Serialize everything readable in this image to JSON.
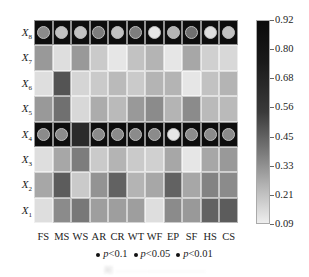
{
  "chart_data": {
    "type": "heatmap",
    "title": "",
    "x_labels": [
      "FS",
      "MS",
      "WS",
      "AR",
      "CR",
      "WT",
      "WF",
      "EP",
      "SF",
      "HS",
      "CS"
    ],
    "y_labels": [
      "X8",
      "X7",
      "X6",
      "X5",
      "X4",
      "X3",
      "X2",
      "X1"
    ],
    "y_labels_display": [
      {
        "base": "X",
        "sub": "8"
      },
      {
        "base": "X",
        "sub": "7"
      },
      {
        "base": "X",
        "sub": "6"
      },
      {
        "base": "X",
        "sub": "5"
      },
      {
        "base": "X",
        "sub": "4"
      },
      {
        "base": "X",
        "sub": "3"
      },
      {
        "base": "X",
        "sub": "2"
      },
      {
        "base": "X",
        "sub": "1"
      }
    ],
    "values": [
      [
        0.92,
        0.92,
        0.92,
        0.92,
        0.92,
        0.92,
        0.92,
        0.92,
        0.92,
        0.92,
        0.92
      ],
      [
        0.4,
        0.15,
        0.4,
        0.22,
        0.12,
        0.25,
        0.3,
        0.12,
        0.35,
        0.2,
        0.17
      ],
      [
        0.15,
        0.65,
        0.18,
        0.22,
        0.28,
        0.22,
        0.3,
        0.3,
        0.12,
        0.25,
        0.3
      ],
      [
        0.4,
        0.55,
        0.17,
        0.33,
        0.28,
        0.4,
        0.45,
        0.3,
        0.45,
        0.28,
        0.28
      ],
      [
        0.92,
        0.92,
        0.8,
        0.92,
        0.92,
        0.92,
        0.92,
        0.92,
        0.92,
        0.92,
        0.92
      ],
      [
        0.15,
        0.35,
        0.5,
        0.22,
        0.3,
        0.22,
        0.2,
        0.35,
        0.12,
        0.35,
        0.4
      ],
      [
        0.35,
        0.62,
        0.22,
        0.42,
        0.6,
        0.3,
        0.35,
        0.6,
        0.35,
        0.48,
        0.45
      ],
      [
        0.15,
        0.45,
        0.52,
        0.38,
        0.38,
        0.38,
        0.15,
        0.45,
        0.4,
        0.6,
        0.62
      ]
    ],
    "significance_markers": {
      "rows": [
        "X8",
        "X4"
      ],
      "X8": [
        0.45,
        0.25,
        0.25,
        0.5,
        0.25,
        0.5,
        0.12,
        0.3,
        0.55,
        0.15,
        0.25
      ],
      "X4": [
        0.45,
        0.45,
        null,
        0.45,
        0.45,
        0.45,
        0.45,
        0.12,
        0.45,
        0.45,
        0.45
      ]
    },
    "colorbar": {
      "ticks": [
        0.92,
        0.8,
        0.68,
        0.56,
        0.45,
        0.33,
        0.21,
        0.09
      ],
      "range": [
        0.09,
        0.92
      ],
      "colormap": "grays"
    },
    "legend": [
      {
        "label": "p<0.1",
        "p": "p",
        "rest": "<0.1"
      },
      {
        "label": "p<0.05",
        "p": "p",
        "rest": "<0.05"
      },
      {
        "label": "p<0.01",
        "p": "p",
        "rest": "<0.01"
      }
    ],
    "legend_position": "bottom",
    "grid": false
  },
  "caption": "图 ······························"
}
